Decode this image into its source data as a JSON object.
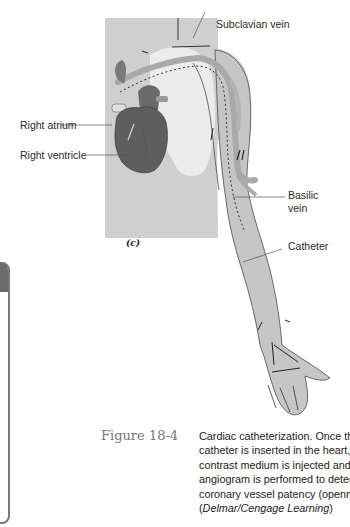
{
  "figure": {
    "panel_tag": "(c)",
    "labels": {
      "subclavian_vein": "Subclavian vein",
      "right_atrium": "Right atrium",
      "right_ventricle": "Right ventricle",
      "basilic_vein_line1": "Basilic",
      "basilic_vein_line2": "vein",
      "catheter": "Catheter"
    },
    "caption": {
      "figure_word": "Figure",
      "figure_number": "18-4",
      "lines": [
        "Cardiac catheterization. Once the",
        "catheter is inserted in the heart, a",
        "contrast medium is injected and an",
        "angiogram is performed to detect",
        "coronary vessel patency (openness)."
      ],
      "credit_open": "(",
      "credit_text": "Delmar/Cengage Learning",
      "credit_close": ")"
    },
    "colors": {
      "body_gray": "#c6c6c6",
      "torso_gray": "#cfcfcf",
      "chest_light": "#ececec",
      "vein_gray": "#a9a9a9",
      "heart_dark": "#5e5e5e",
      "outline": "#4a4a4a",
      "caption_number": "#777777"
    }
  }
}
